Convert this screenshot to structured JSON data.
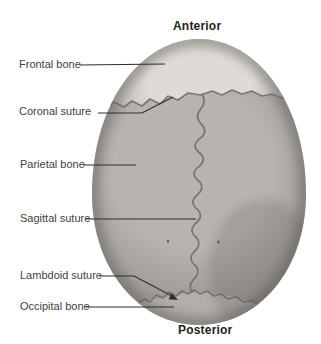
{
  "figure": {
    "orientation_top": "Anterior",
    "orientation_bottom": "Posterior",
    "labels": [
      {
        "text": "Frontal bone"
      },
      {
        "text": "Coronal suture"
      },
      {
        "text": "Parietal bone"
      },
      {
        "text": "Sagittal suture"
      },
      {
        "text": "Lambdoid suture"
      },
      {
        "text": "Occipital bone"
      }
    ],
    "colors": {
      "background": "#ffffff",
      "label_text": "#3f3f3f",
      "orientation_text": "#232323",
      "leader_line": "#2e2e2e",
      "suture_line": "#6f6964",
      "frontal_highlight": "#dedbd7",
      "frontal_shade": "#a5a19d",
      "parietal_light": "#b7b3b0",
      "parietal_dark": "#8b8784",
      "occipital_patch": "#b8b4b0",
      "vignette": "#5f5b58",
      "foramina_dot": "#6b6560"
    }
  }
}
